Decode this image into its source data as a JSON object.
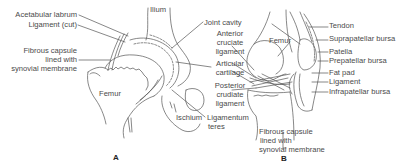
{
  "figure": {
    "panels": [
      {
        "id": "A",
        "letter": "A",
        "subject": "hip joint",
        "labels": {
          "acetabular_labrum": "Acetabular labrum",
          "ligament_cut": "Ligament (cut)",
          "fibrous_capsule_1": "Fibrous capsule",
          "fibrous_capsule_2": "lined with",
          "fibrous_capsule_3": "synovial membrane",
          "ilium": "Ilium",
          "femur": "Femur",
          "ischium": "Ischium",
          "ligamentum_teres_1": "Ligamentum",
          "ligamentum_teres_2": "teres"
        }
      },
      {
        "id": "B",
        "letter": "B",
        "subject": "knee joint",
        "labels": {
          "joint_cavity": "Joint cavity",
          "anterior_cruciate_1": "Anterior",
          "anterior_cruciate_2": "cruciate",
          "anterior_cruciate_3": "ligament",
          "articular_cartilage_1": "Articular",
          "articular_cartilage_2": "cartilage",
          "posterior_cruciate_1": "Posterior",
          "posterior_cruciate_2": "crudiate",
          "posterior_cruciate_3": "ligament",
          "femur": "Femur",
          "tendon": "Tendon",
          "suprapatellar_bursa": "Suprapatellar bursa",
          "patella": "Patella",
          "prepatellar_bursa": "Prepatellar bursa",
          "fat_pad": "Fat pad",
          "ligament": "Ligament",
          "infrapatellar_bursa": "Infrapatellar bursa",
          "fibrous_capsule_1": "Fibrous capsule",
          "fibrous_capsule_2": "lined with",
          "fibrous_capsule_3": "synovial membrane"
        }
      }
    ],
    "colors": {
      "line": "#555555",
      "text": "#4a4a4a",
      "background": "#ffffff"
    }
  }
}
